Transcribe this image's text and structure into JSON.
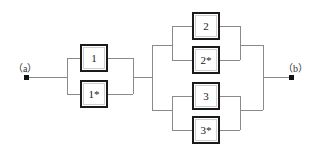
{
  "diagram": {
    "type": "reliability-block-diagram",
    "terminals": [
      {
        "id": "a",
        "label": "（a）",
        "x": 27,
        "y": 78
      },
      {
        "id": "b",
        "label": "（b）",
        "x": 291,
        "y": 78
      }
    ],
    "blocks": [
      {
        "id": "1",
        "label": "1",
        "x": 80,
        "y": 44,
        "w": 28,
        "h": 28
      },
      {
        "id": "1s",
        "label": "1*",
        "x": 80,
        "y": 80,
        "w": 28,
        "h": 28
      },
      {
        "id": "2",
        "label": "2",
        "x": 192,
        "y": 12,
        "w": 28,
        "h": 28
      },
      {
        "id": "2s",
        "label": "2*",
        "x": 192,
        "y": 46,
        "w": 28,
        "h": 28
      },
      {
        "id": "3",
        "label": "3",
        "x": 192,
        "y": 82,
        "w": 28,
        "h": 28
      },
      {
        "id": "3s",
        "label": "3*",
        "x": 192,
        "y": 116,
        "w": 28,
        "h": 28
      }
    ],
    "colors": {
      "block_border": "#1a1a1a",
      "block_inner": "#cfcfcf",
      "wire": "#8a8a8a",
      "terminal": "#111111",
      "background": "#ffffff",
      "text": "#1a1a1a"
    },
    "groups": [
      {
        "name": "group-1",
        "members": [
          "1",
          "1*"
        ],
        "arrangement": "parallel"
      },
      {
        "name": "group-2",
        "members": [
          "2",
          "2*"
        ],
        "arrangement": "parallel"
      },
      {
        "name": "group-3",
        "members": [
          "3",
          "3*"
        ],
        "arrangement": "parallel"
      },
      {
        "name": "group-23",
        "members": [
          "group-2",
          "group-3"
        ],
        "arrangement": "parallel"
      },
      {
        "name": "system",
        "members": [
          "group-1",
          "group-23"
        ],
        "arrangement": "series"
      }
    ]
  }
}
